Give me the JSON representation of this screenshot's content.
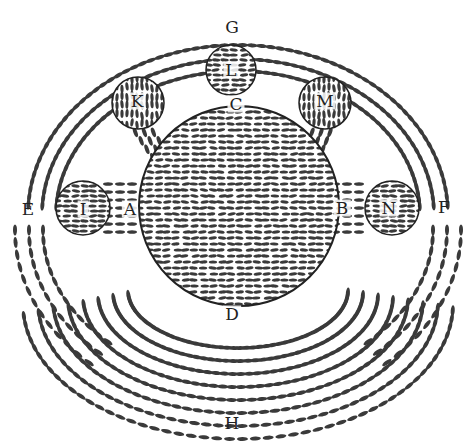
{
  "colors": {
    "ink": "#3a3a3a",
    "paper": "#ffffff"
  },
  "bodies": [
    {
      "id": "earth",
      "label": "C/D/A/B",
      "cx": 239,
      "cy": 206,
      "r": 100
    },
    {
      "id": "L",
      "label": "L",
      "cx": 231,
      "cy": 70,
      "r": 25
    },
    {
      "id": "K",
      "label": "K",
      "cx": 138,
      "cy": 103,
      "r": 26
    },
    {
      "id": "M",
      "label": "M",
      "cx": 325,
      "cy": 103,
      "r": 26
    },
    {
      "id": "I",
      "label": "I",
      "cx": 83,
      "cy": 208,
      "r": 27
    },
    {
      "id": "N",
      "label": "N",
      "cx": 392,
      "cy": 208,
      "r": 27
    }
  ],
  "labels": {
    "G": "G",
    "C": "C",
    "L": "L",
    "K": "K",
    "M": "M",
    "E": "E",
    "I": "I",
    "A": "A",
    "B": "B",
    "N": "N",
    "F": "F",
    "D": "D",
    "H": "H"
  }
}
